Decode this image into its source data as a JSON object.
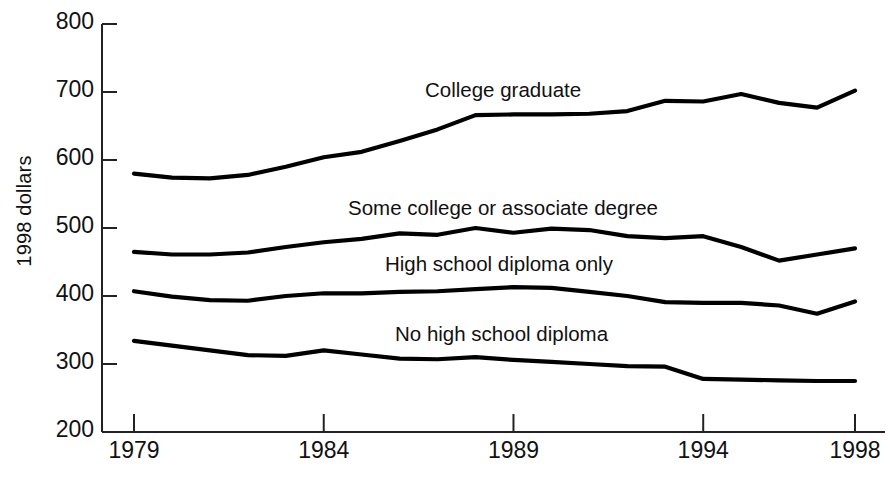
{
  "chart_data": {
    "type": "line",
    "title": "",
    "xlabel": "",
    "ylabel": "1998 dollars",
    "xlim": [
      1979,
      1998
    ],
    "ylim": [
      200,
      800
    ],
    "grid": false,
    "legend_position": "inline-annotations",
    "yticks": [
      800,
      700,
      600,
      500,
      400,
      300,
      200
    ],
    "xticks": [
      1979,
      1984,
      1989,
      1994,
      1998
    ],
    "x": [
      1979,
      1980,
      1981,
      1982,
      1983,
      1984,
      1985,
      1986,
      1987,
      1988,
      1989,
      1990,
      1991,
      1992,
      1993,
      1994,
      1995,
      1996,
      1997,
      1998
    ],
    "series": [
      {
        "name": "College graduate",
        "label": "College graduate",
        "color": "#000000",
        "values": [
          580,
          574,
          573,
          578,
          590,
          604,
          612,
          628,
          645,
          666,
          667,
          667,
          668,
          672,
          687,
          686,
          697,
          684,
          677,
          702
        ]
      },
      {
        "name": "Some college or associate degree",
        "label": "Some college or associate degree",
        "color": "#000000",
        "values": [
          465,
          461,
          461,
          464,
          472,
          479,
          484,
          492,
          490,
          500,
          493,
          499,
          497,
          488,
          485,
          488,
          472,
          452,
          461,
          470
        ]
      },
      {
        "name": "High school diploma only",
        "label": "High school diploma only",
        "color": "#000000",
        "values": [
          407,
          399,
          394,
          393,
          400,
          404,
          404,
          406,
          407,
          410,
          413,
          412,
          406,
          400,
          391,
          390,
          390,
          386,
          374,
          392
        ]
      },
      {
        "name": "No high school diploma",
        "label": "No high school diploma",
        "color": "#000000",
        "values": [
          334,
          327,
          320,
          313,
          312,
          320,
          314,
          308,
          307,
          310,
          306,
          303,
          300,
          297,
          296,
          278,
          277,
          276,
          275,
          275
        ]
      }
    ]
  },
  "axis": {
    "y_title": "1998 dollars",
    "y_tick_labels": [
      "800",
      "700",
      "600",
      "500",
      "400",
      "300",
      "200"
    ],
    "x_tick_labels": [
      "1979",
      "1984",
      "1989",
      "1994",
      "1998"
    ]
  },
  "annotations": {
    "college_graduate": "College graduate",
    "some_college": "Some college or associate degree",
    "high_school": "High school diploma only",
    "no_high_school": "No high school diploma"
  },
  "style": {
    "axis_color": "#222222",
    "line_color": "#000000",
    "background": "#ffffff"
  }
}
